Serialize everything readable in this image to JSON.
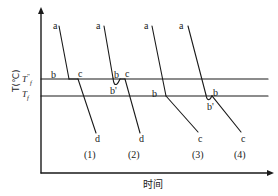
{
  "figure": {
    "axes": {
      "y_label": "T(℃)",
      "x_label": "时间",
      "y_axis_x": 41,
      "x_axis_y": 173,
      "x_axis_end": 272,
      "y_axis_top": 8
    },
    "temperature_lines": [
      {
        "name": "tf-double-prime",
        "label_main": "T",
        "label_sub": "f",
        "label_sup": "\"",
        "y": 79
      },
      {
        "name": "tf",
        "label_main": "T",
        "label_sub": "f",
        "label_sup": "",
        "y": 96
      }
    ],
    "sample_labels": [
      {
        "text": "(1)",
        "x": 84,
        "y": 150
      },
      {
        "text": "(2)",
        "x": 128,
        "y": 150
      },
      {
        "text": "(3)",
        "x": 192,
        "y": 150
      },
      {
        "text": "(4)",
        "x": 234,
        "y": 150
      }
    ],
    "curve_point_labels": [
      {
        "text": "a",
        "x": 53,
        "y": 21
      },
      {
        "text": "b",
        "x": 51,
        "y": 70
      },
      {
        "text": "c",
        "x": 78,
        "y": 69
      },
      {
        "text": "d",
        "x": 95,
        "y": 134
      },
      {
        "text": "a",
        "x": 96,
        "y": 21
      },
      {
        "text": "b",
        "x": 114,
        "y": 70
      },
      {
        "text": "b",
        "x": 110,
        "y": 86,
        "prime": "'"
      },
      {
        "text": "c",
        "x": 125,
        "y": 69
      },
      {
        "text": "d",
        "x": 139,
        "y": 134
      },
      {
        "text": "a",
        "x": 144,
        "y": 21
      },
      {
        "text": "b",
        "x": 152,
        "y": 89
      },
      {
        "text": "c",
        "x": 198,
        "y": 134
      },
      {
        "text": "a",
        "x": 179,
        "y": 21
      },
      {
        "text": "b",
        "x": 213,
        "y": 88
      },
      {
        "text": "b",
        "x": 207,
        "y": 102,
        "prime": "'"
      },
      {
        "text": "c",
        "x": 241,
        "y": 134
      }
    ],
    "curves": [
      {
        "name": "cooling-curve-1-ab",
        "path": "M 59,26 L 69,79"
      },
      {
        "name": "cooling-curve-1-plateau",
        "path": "M 69,79 L 78,79"
      },
      {
        "name": "cooling-curve-1-cd",
        "path": "M 78,79 L 96,133"
      },
      {
        "name": "cooling-curve-2-ab",
        "path": "M 104,26 L 113,78"
      },
      {
        "name": "cooling-curve-2-undercool",
        "path": "M 113,78 C 113.5,84 115,85.5 117,84 C 118.5,82.8 119.5,80 120,79"
      },
      {
        "name": "cooling-curve-2-plateau",
        "path": "M 120,79 L 125,79"
      },
      {
        "name": "cooling-curve-2-cd",
        "path": "M 125,79 L 140,133"
      },
      {
        "name": "cooling-curve-3-ab",
        "path": "M 152,26 L 166,96"
      },
      {
        "name": "cooling-curve-3-bc",
        "path": "M 166,96 L 198,132"
      },
      {
        "name": "cooling-curve-4-ab",
        "path": "M 188,26 L 206,95"
      },
      {
        "name": "cooling-curve-4-undercool",
        "path": "M 206,95 C 206.5,99 208,100.5 210,99 C 211,98.2 211.5,96.5 212,95.8"
      },
      {
        "name": "cooling-curve-4-bc",
        "path": "M 212,95.8 L 241,132"
      }
    ],
    "colors": {
      "stroke": "#1a1a1a",
      "background": "#ffffff"
    }
  }
}
